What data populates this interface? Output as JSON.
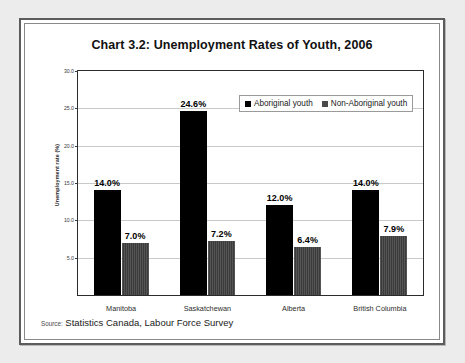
{
  "figure": {
    "title": "Chart 3.2:  Unemployment Rates of Youth, 2006",
    "source_prefix": "Source:",
    "source_text": "Statistics Canada, Labour Force Survey"
  },
  "legend": {
    "position": "top-right-inside",
    "items": [
      {
        "label": "Aboriginal youth",
        "color": "#000000"
      },
      {
        "label": "Non-Aboriginal youth",
        "color": "#4a4a4a"
      }
    ]
  },
  "axis": {
    "y_title": "Unemployment rate (%)",
    "y_ticks": [
      "30.0",
      "25.0",
      "20.0",
      "15.0",
      "10.0",
      "5.0"
    ]
  },
  "chart_data": {
    "type": "bar",
    "title": "Chart 3.2:  Unemployment Rates of Youth, 2006",
    "xlabel": "",
    "ylabel": "Unemployment rate (%)",
    "ylim": [
      0,
      30
    ],
    "ytick_step": 5,
    "grid": true,
    "legend_position": "upper right",
    "categories": [
      "Manitoba",
      "Saskatchewan",
      "Alberta",
      "British Columbia"
    ],
    "series": [
      {
        "name": "Aboriginal youth",
        "color": "#000000",
        "values": [
          14.0,
          24.6,
          12.0,
          14.0
        ],
        "labels": [
          "14.0%",
          "24.6%",
          "12.0%",
          "14.0%"
        ]
      },
      {
        "name": "Non-Aboriginal youth",
        "color": "#4a4a4a",
        "values": [
          7.0,
          7.2,
          6.4,
          7.9
        ],
        "labels": [
          "7.0%",
          "7.2%",
          "6.4%",
          "7.9%"
        ]
      }
    ]
  }
}
